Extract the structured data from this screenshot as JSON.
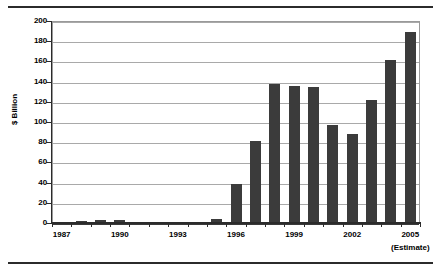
{
  "chart_data": {
    "type": "bar",
    "title": "",
    "subtitle": "",
    "xlabel": "",
    "ylabel": "$ Billion",
    "ylim": [
      0,
      200
    ],
    "y_ticks": [
      0,
      20,
      40,
      60,
      80,
      100,
      120,
      140,
      160,
      180,
      200
    ],
    "y_tick_labels": [
      "0",
      "20",
      "40",
      "60",
      "80",
      "100",
      "120",
      "140",
      "160",
      "180",
      "200"
    ],
    "grid": true,
    "legend": null,
    "bar_color": "#3b3b3b",
    "categories": [
      "1987",
      "1988",
      "1989",
      "1990",
      "1991",
      "1992",
      "1993",
      "1994",
      "1995",
      "1996",
      "1997",
      "1998",
      "1999",
      "2000",
      "2001",
      "2002",
      "2003",
      "2004",
      "2005"
    ],
    "values": [
      0.5,
      2,
      2.5,
      3,
      0.8,
      0.3,
      1,
      1,
      4,
      39,
      81,
      138,
      136,
      135,
      97,
      88,
      122,
      161,
      189
    ],
    "x_tick_labels": [
      "1987",
      "1990",
      "1993",
      "1996",
      "1999",
      "2002",
      "2005"
    ],
    "x_tick_categories": [
      "1987",
      "1990",
      "1993",
      "1996",
      "1999",
      "2002",
      "2005"
    ],
    "annotations": [
      {
        "text": "(Estimate)",
        "attached_to": "2005"
      }
    ]
  },
  "axes": {
    "y_title": "$ Billion"
  },
  "notes": {
    "estimate": "(Estimate)"
  }
}
